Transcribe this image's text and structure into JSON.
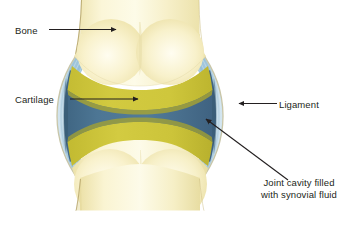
{
  "diagram": {
    "labels": {
      "bone": "Bone",
      "cartilage": "Cartilage",
      "ligament": "Ligament",
      "joint_cavity": "Joint cavity filled with synovial fluid"
    },
    "colors": {
      "background": "#ffffff",
      "bone_light": "#fdf8dc",
      "bone_mid": "#f3eab4",
      "bone_shadow": "#e7da98",
      "bone_outline": "#b5a46a",
      "cartilage": "#ccc43a",
      "cartilage_dark": "#b9b133",
      "joint_cavity": "#4a7391",
      "joint_cavity_dark": "#3c607c",
      "ligament": "#a9cbdf",
      "ligament_edge": "#8fbcd6",
      "capsule_outline": "#c9c6a8",
      "leader_line": "#231f20",
      "text": "#231f20"
    }
  }
}
